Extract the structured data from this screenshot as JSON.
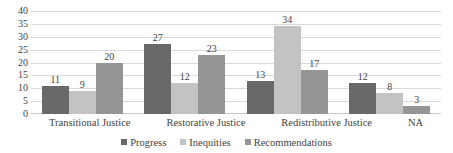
{
  "chart_data": {
    "type": "bar",
    "title": "",
    "subtitle": "",
    "xlabel": "",
    "ylabel": "",
    "ylim": [
      0,
      40
    ],
    "ytick_step": 5,
    "yticks": [
      40,
      35,
      30,
      25,
      20,
      15,
      10,
      5,
      0
    ],
    "grid": true,
    "legend_position": "bottom",
    "categories": [
      "Transitional Justice",
      "Restorative Justice",
      "Redistributive Justice",
      "NA"
    ],
    "series": [
      {
        "name": "Progress",
        "color": "#696969",
        "values": [
          11,
          27,
          13,
          12
        ]
      },
      {
        "name": "Inequities",
        "color": "#c3c3c3",
        "values": [
          9,
          12,
          34,
          8
        ]
      },
      {
        "name": "Recommendations",
        "color": "#959595",
        "values": [
          20,
          23,
          17,
          3
        ]
      }
    ]
  },
  "colors": {
    "background": "#ffffff",
    "gridline": "#d9d9d9",
    "text": "#3f3f3f",
    "series_progress": "#696969",
    "series_inequities": "#c3c3c3",
    "series_recommendations": "#959595"
  }
}
